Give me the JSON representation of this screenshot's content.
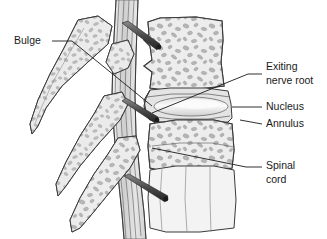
{
  "figure": {
    "background_color": "#ffffff",
    "line_color": "#3a3a3a",
    "bone_fill": "#e9e9e9",
    "trabecula_fill": "#b5b5b5",
    "nucleus_fill": "#f2f2f2",
    "cord_fill": "#d8d8d8",
    "label_color": "#1a1a1a"
  },
  "labels": [
    {
      "id": "bulge",
      "text": "Bulge",
      "anchor": "start",
      "x": 14,
      "y": 41,
      "leader": "M 52 41 L 72 41 L 152 106"
    },
    {
      "id": "exiting-nerve-root",
      "text_line1": "Exiting",
      "text_line2": "nerve root",
      "anchor": "start",
      "x": 266,
      "y": 73,
      "leader": "M 262 74 L 248 74 L 152 113"
    },
    {
      "id": "nucleus",
      "text": "Nucleus",
      "anchor": "start",
      "x": 266,
      "y": 107,
      "leader": "M 262 107 L 232 107"
    },
    {
      "id": "annulus",
      "text": "Annulus",
      "anchor": "start",
      "x": 266,
      "y": 124,
      "leader": "M 262 124 L 240 120"
    },
    {
      "id": "spinal-cord",
      "text_line1": "Spinal",
      "text_line2": "cord",
      "anchor": "start",
      "x": 266,
      "y": 172,
      "leader": "M 262 167 L 246 167 L 152 148"
    }
  ],
  "structures": [
    {
      "id": "upper-vertebral-body",
      "name": "Upper vertebral body"
    },
    {
      "id": "lower-vertebral-body",
      "name": "Lower vertebral body"
    },
    {
      "id": "bottom-vertebral-body",
      "name": "Bottom vertebral body"
    },
    {
      "id": "intervertebral-disc",
      "name": "Intervertebral disc"
    },
    {
      "id": "nucleus-pulposus",
      "name": "Nucleus pulposus"
    },
    {
      "id": "annulus-fibrosus",
      "name": "Annulus fibrosus"
    },
    {
      "id": "spinal-canal",
      "name": "Spinal canal and cord"
    },
    {
      "id": "spinous-process-upper",
      "name": "Upper spinous process"
    },
    {
      "id": "spinous-process-middle",
      "name": "Middle spinous process"
    },
    {
      "id": "spinous-process-lower",
      "name": "Lower spinous process"
    },
    {
      "id": "nerve-root-upper",
      "name": "Upper exiting nerve root"
    },
    {
      "id": "nerve-root-middle",
      "name": "Middle exiting nerve root"
    },
    {
      "id": "nerve-root-lower",
      "name": "Lower exiting nerve root"
    },
    {
      "id": "disc-bulge",
      "name": "Disc bulge"
    }
  ]
}
